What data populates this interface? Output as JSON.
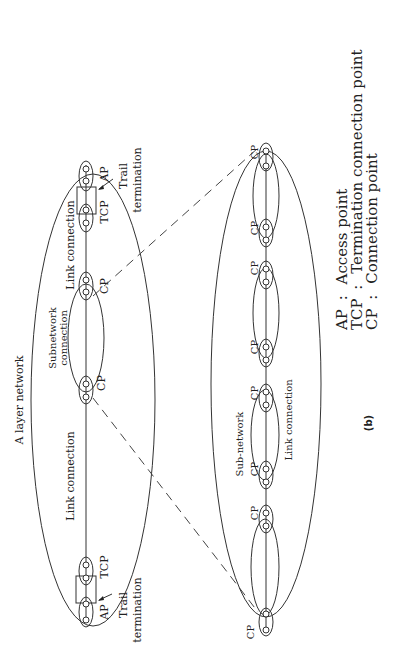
{
  "figure": {
    "orientation": "rotated-90-ccw",
    "caption": "(b)",
    "top_network": {
      "title": "A layer network",
      "labels": {
        "link_connection_left": "Link connection",
        "link_connection_right": "Link connection",
        "subnetwork_connection_line1": "Subnetwork",
        "subnetwork_connection_line2": "connection",
        "trail_termination_left_line1": "Trail",
        "trail_termination_left_line2": "termination",
        "trail_termination_right_line1": "Trail",
        "trail_termination_right_line2": "termination",
        "ap_left": "AP",
        "ap_right": "AP",
        "tcp_left": "TCP",
        "tcp_right": "TCP",
        "cp_left": "CP",
        "cp_right": "CP"
      }
    },
    "sub_network": {
      "labels": {
        "sub_network": "Sub-network",
        "link_connection": "Link connection",
        "cp_nodes": [
          "CP",
          "CP",
          "CP",
          "CP",
          "CP",
          "CP",
          "CP",
          "CP"
        ]
      }
    },
    "legend": [
      {
        "abbr": "AP",
        "sep": ":",
        "text": "Access point"
      },
      {
        "abbr": "TCP",
        "sep": ":",
        "text": "Termination connection point"
      },
      {
        "abbr": "CP",
        "sep": ":",
        "text": "Connection point"
      }
    ]
  }
}
